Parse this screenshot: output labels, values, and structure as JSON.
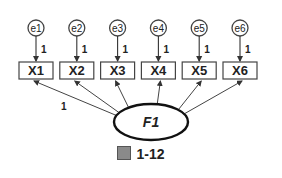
{
  "diagram": {
    "type": "structural-equation-model",
    "latent": {
      "label": "F1"
    },
    "errors": [
      "e1",
      "e2",
      "e3",
      "e4",
      "e5",
      "e6"
    ],
    "observed": [
      "X1",
      "X2",
      "X3",
      "X4",
      "X5",
      "X6"
    ],
    "error_loadings": [
      "1",
      "1",
      "1",
      "1",
      "1",
      "1"
    ],
    "fixed_loading_label": "1"
  },
  "caption": {
    "label": "1-12"
  }
}
